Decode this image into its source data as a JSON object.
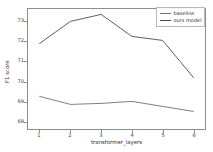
{
  "chart_data": {
    "type": "line",
    "title": "",
    "xlabel": "transformer_layers",
    "ylabel": "F1 score",
    "x": [
      1,
      2,
      3,
      4,
      5,
      6
    ],
    "xtick_labels": [
      "1",
      "2",
      "3",
      "4",
      "5",
      "6"
    ],
    "ytick_labels": [
      "68",
      "69",
      "70",
      "71",
      "72",
      "73"
    ],
    "ytick_values": [
      68,
      69,
      70,
      71,
      72,
      73
    ],
    "xlim": [
      0.62,
      6.38
    ],
    "ylim": [
      67.62,
      73.62
    ],
    "grid": false,
    "legend_position": "upper right",
    "series": [
      {
        "name": "baseline",
        "color": "#6f6f6f",
        "values": [
          69.25,
          68.85,
          68.9,
          69.0,
          68.75,
          68.5
        ]
      },
      {
        "name": "ours model",
        "color": "#4a4a4a",
        "values": [
          71.9,
          73.0,
          73.35,
          72.25,
          72.05,
          70.2
        ]
      }
    ]
  },
  "legend": {
    "entries": [
      {
        "label": "baseline"
      },
      {
        "label": "ours model"
      }
    ]
  },
  "axes": {
    "x_title": "transformer_layers",
    "y_title": "F1 score"
  },
  "colors": {
    "axis": "#8d8d8d",
    "text": "#2b2b2b",
    "background": "#ffffff"
  }
}
